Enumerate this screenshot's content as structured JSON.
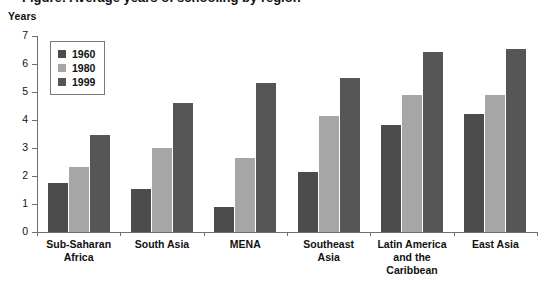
{
  "figure": {
    "caption_clipped": "Figure: Average years of schooling by region",
    "y_axis_unit": "Years"
  },
  "legend": {
    "position": "top-left-inside",
    "entries": [
      {
        "label": "1960",
        "color": "#4c4c4c",
        "swatch_icon": "square-swatch-icon"
      },
      {
        "label": "1980",
        "color": "#a6a6a6",
        "swatch_icon": "square-swatch-icon"
      },
      {
        "label": "1999",
        "color": "#565656",
        "swatch_icon": "square-swatch-icon"
      }
    ]
  },
  "axis": {
    "y_ticks": [
      "0",
      "1",
      "2",
      "3",
      "4",
      "5",
      "6",
      "7"
    ]
  },
  "categories": [
    {
      "line1": "Sub-Saharan",
      "line2": "Africa",
      "line3": ""
    },
    {
      "line1": "South Asia",
      "line2": "",
      "line3": ""
    },
    {
      "line1": "MENA",
      "line2": "",
      "line3": ""
    },
    {
      "line1": "Southeast",
      "line2": "Asia",
      "line3": ""
    },
    {
      "line1": "Latin America",
      "line2": "and the",
      "line3": "Caribbean"
    },
    {
      "line1": "East Asia",
      "line2": "",
      "line3": ""
    }
  ],
  "chart_data": {
    "type": "bar",
    "title": "",
    "xlabel": "",
    "ylabel": "Years",
    "ylim": [
      0,
      7
    ],
    "ytick_step": 1,
    "grid": false,
    "legend_position": "top-left-inside",
    "categories": [
      "Sub-Saharan Africa",
      "South Asia",
      "MENA",
      "Southeast Asia",
      "Latin America and the Caribbean",
      "East Asia"
    ],
    "series": [
      {
        "name": "1960",
        "color": "#4c4c4c",
        "values": [
          1.75,
          1.53,
          0.88,
          2.15,
          3.83,
          4.23
        ]
      },
      {
        "name": "1980",
        "color": "#a6a6a6",
        "values": [
          2.33,
          3.0,
          2.63,
          4.13,
          4.9,
          4.9
        ]
      },
      {
        "name": "1999",
        "color": "#565656",
        "values": [
          3.45,
          4.62,
          5.33,
          5.5,
          6.43,
          6.53
        ]
      }
    ]
  }
}
